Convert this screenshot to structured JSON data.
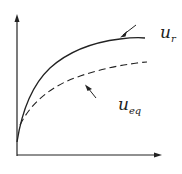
{
  "diagram": {
    "curves": [
      {
        "name": "u_r",
        "style": "solid",
        "label_base": "u",
        "label_sub": "r"
      },
      {
        "name": "u_eq",
        "style": "dashed",
        "label_base": "u",
        "label_sub": "eq"
      }
    ],
    "axes": {
      "x_label": "",
      "y_label": ""
    },
    "colors": {
      "line": "#222222",
      "background": "#ffffff"
    }
  }
}
